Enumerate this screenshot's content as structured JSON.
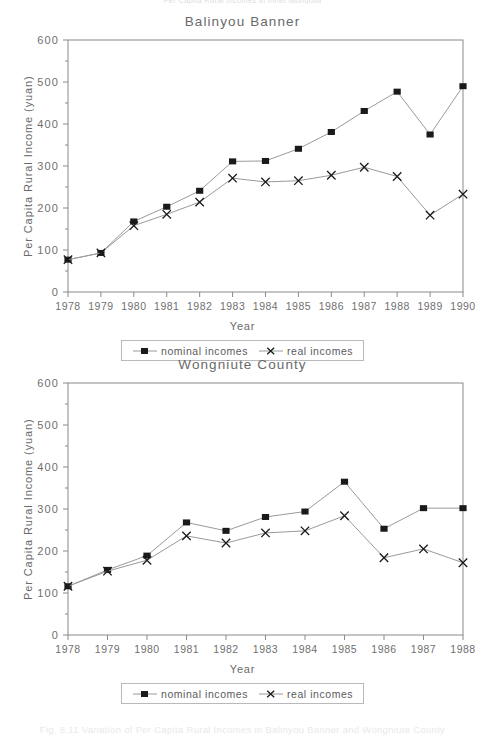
{
  "page": {
    "top_clipped_text": "Per Capita Rural Incomes in Inner Mongolia",
    "caption": "Fig. 8.11  Variation of Per Capita Rural Incomes in Balinyou Banner and Wongniute County"
  },
  "colors": {
    "axis": "#8a8a8a",
    "text": "#6a6a6a",
    "line_nominal": "#9a9a9a",
    "line_real": "#9a9a9a",
    "marker_nominal": "#1a1a1a",
    "marker_real": "#1a1a1a",
    "legend_border": "#b9b9b9",
    "background": "#ffffff"
  },
  "legend": {
    "nominal_label": "nominal incomes",
    "real_label": "real incomes",
    "nominal_key_icon": "filled-square-marker",
    "real_key_icon": "cross-marker"
  },
  "chart_data": [
    {
      "id": "balinyou-banner",
      "type": "line",
      "title": "Balinyou Banner",
      "xlabel": "Year",
      "ylabel": "Per Capita Rural Income (yuan)",
      "x": [
        "1978",
        "1979",
        "1980",
        "1981",
        "1982",
        "1983",
        "1984",
        "1985",
        "1986",
        "1987",
        "1988",
        "1989",
        "1990"
      ],
      "ylim": [
        0,
        600
      ],
      "yticks": [
        0,
        100,
        200,
        300,
        400,
        500,
        600
      ],
      "ytick_labels": [
        "0",
        "100",
        "200",
        "300",
        "400",
        "500",
        "600"
      ],
      "grid": false,
      "legend_position": "below-axis-center",
      "series": [
        {
          "name": "nominal incomes",
          "marker": "filled-square",
          "values": [
            77,
            93,
            168,
            203,
            241,
            311,
            312,
            341,
            381,
            431,
            477,
            375,
            490
          ]
        },
        {
          "name": "real incomes",
          "marker": "cross",
          "values": [
            77,
            93,
            158,
            185,
            214,
            271,
            262,
            265,
            278,
            297,
            275,
            183,
            233
          ]
        }
      ]
    },
    {
      "id": "wongniute-county",
      "type": "line",
      "title": "Wongniute County",
      "xlabel": "Year",
      "ylabel": "Per Capita Rural Income (yuan)",
      "x": [
        "1978",
        "1979",
        "1980",
        "1981",
        "1982",
        "1983",
        "1984",
        "1985",
        "1986",
        "1987",
        "1988"
      ],
      "ylim": [
        0,
        600
      ],
      "yticks": [
        0,
        100,
        200,
        300,
        400,
        500,
        600
      ],
      "ytick_labels": [
        "0",
        "100",
        "200",
        "300",
        "400",
        "500",
        "600"
      ],
      "grid": false,
      "legend_position": "below-axis-center",
      "series": [
        {
          "name": "nominal incomes",
          "marker": "filled-square",
          "values": [
            116,
            155,
            189,
            268,
            248,
            281,
            294,
            365,
            253,
            302,
            302
          ]
        },
        {
          "name": "real incomes",
          "marker": "cross",
          "values": [
            116,
            152,
            178,
            236,
            219,
            243,
            248,
            284,
            184,
            205,
            172
          ]
        }
      ]
    }
  ]
}
